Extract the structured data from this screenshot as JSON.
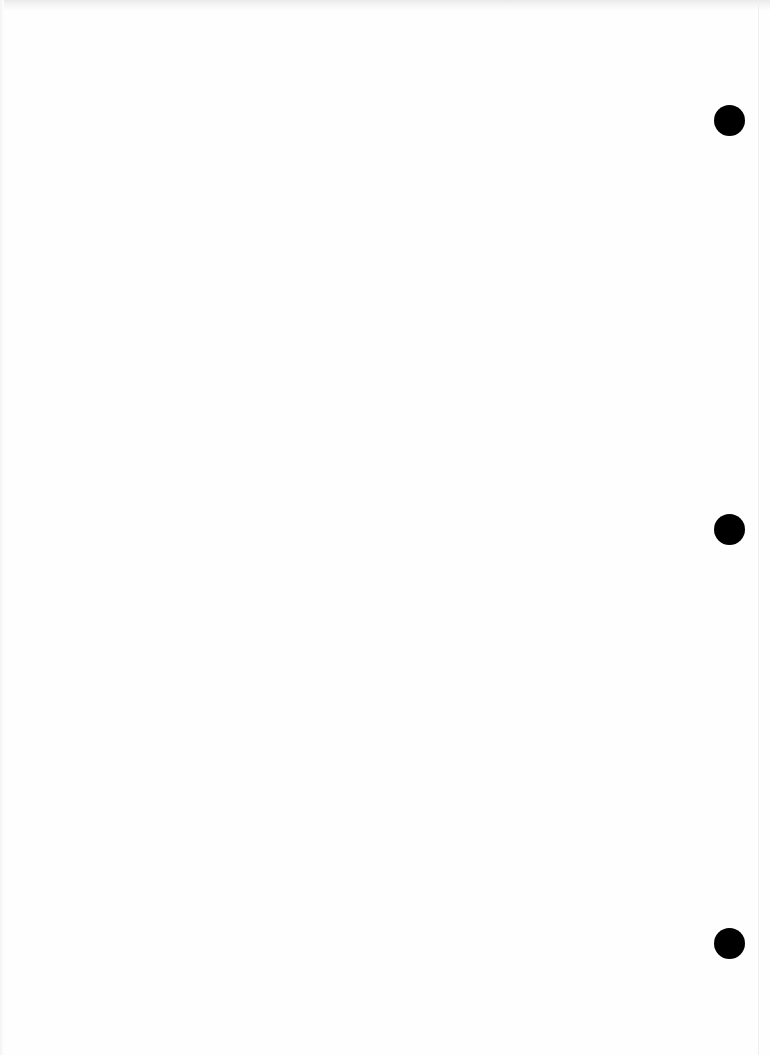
{
  "document": {
    "type": "blank scanned page",
    "background_color": "#fefefe",
    "punch_hole_color": "#000000",
    "punch_holes": [
      {
        "cx": 729,
        "cy": 120,
        "r": 15
      },
      {
        "cx": 729,
        "cy": 529,
        "r": 15
      },
      {
        "cx": 729,
        "cy": 943,
        "r": 15
      }
    ]
  }
}
